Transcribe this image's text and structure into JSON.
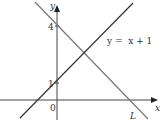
{
  "figure": {
    "axes": {
      "x_label": "x",
      "y_label": "y",
      "origin_label": "0",
      "y_ticks": [
        {
          "value": 4,
          "label": "4"
        },
        {
          "value": 1,
          "label": "1"
        }
      ]
    },
    "lines": [
      {
        "name": "y = x + 1",
        "label": "y =  x + 1",
        "gradient": 1,
        "y_intercept": 1,
        "color": "#333333"
      },
      {
        "name": "L",
        "label": "L",
        "gradient": -1,
        "y_intercept": 4,
        "color": "#777777"
      }
    ],
    "colors": {
      "axes": "#444444",
      "line_main": "#333333",
      "line_L": "#777777",
      "background": "#ffffff"
    }
  }
}
